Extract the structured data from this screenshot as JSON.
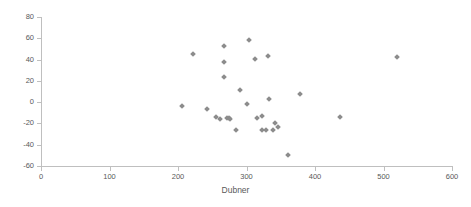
{
  "chart_data": {
    "type": "scatter",
    "title": "",
    "xlabel": "Dubner",
    "ylabel": "Residuals",
    "xlim": [
      0,
      600
    ],
    "ylim": [
      -60,
      80
    ],
    "xticks": [
      0,
      100,
      200,
      300,
      400,
      500,
      600
    ],
    "yticks": [
      -60,
      -40,
      -20,
      0,
      20,
      40,
      60,
      80
    ],
    "grid": false,
    "legend": false,
    "marker": {
      "shape": "diamond",
      "color": "#8c8c8c",
      "size": 4
    },
    "series": [
      {
        "name": "Residuals",
        "points": [
          {
            "x": 206,
            "y": -4
          },
          {
            "x": 222,
            "y": 45
          },
          {
            "x": 243,
            "y": -6
          },
          {
            "x": 255,
            "y": -14
          },
          {
            "x": 262,
            "y": -16
          },
          {
            "x": 267,
            "y": 53
          },
          {
            "x": 267,
            "y": 38
          },
          {
            "x": 267,
            "y": 24
          },
          {
            "x": 272,
            "y": -15
          },
          {
            "x": 274,
            "y": -15
          },
          {
            "x": 276,
            "y": -16
          },
          {
            "x": 284,
            "y": -26
          },
          {
            "x": 290,
            "y": 11
          },
          {
            "x": 300,
            "y": -2
          },
          {
            "x": 303,
            "y": 58
          },
          {
            "x": 312,
            "y": 41
          },
          {
            "x": 316,
            "y": -15
          },
          {
            "x": 322,
            "y": -13
          },
          {
            "x": 322,
            "y": -26
          },
          {
            "x": 329,
            "y": -26
          },
          {
            "x": 331,
            "y": 43
          },
          {
            "x": 333,
            "y": 3
          },
          {
            "x": 338,
            "y": -26
          },
          {
            "x": 341,
            "y": -20
          },
          {
            "x": 346,
            "y": -23
          },
          {
            "x": 360,
            "y": -50
          },
          {
            "x": 378,
            "y": 8
          },
          {
            "x": 436,
            "y": -14
          },
          {
            "x": 519,
            "y": 42
          }
        ]
      }
    ]
  },
  "axes": {
    "x_tick_labels": [
      "0",
      "100",
      "200",
      "300",
      "400",
      "500",
      "600"
    ],
    "y_tick_labels": [
      "-60",
      "-40",
      "-20",
      "0",
      "20",
      "40",
      "60",
      "80"
    ],
    "x_title": "Dubner",
    "y_title": "Residuals"
  },
  "colors": {
    "marker": "#8c8c8c",
    "axis": "#bfbfbf",
    "text": "#595959",
    "background": "#ffffff"
  }
}
